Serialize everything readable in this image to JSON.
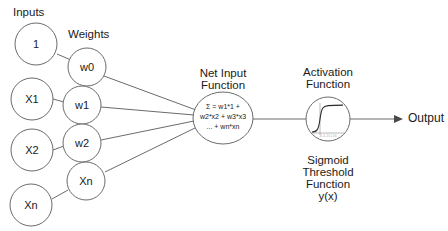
{
  "diagram": {
    "title_labels": {
      "inputs": "Inputs",
      "weights": "Weights",
      "net_input_function_line1": "Net Input",
      "net_input_function_line2": "Function",
      "activation_function_line1": "Activation",
      "activation_function_line2": "Function",
      "sigmoid_caption_line1": "Sigmoid",
      "sigmoid_caption_line2": "Threshold",
      "sigmoid_caption_line3": "Function",
      "sigmoid_caption_line4": "y(x)",
      "output": "Output"
    },
    "input_nodes": [
      {
        "label": "1"
      },
      {
        "label": "X1"
      },
      {
        "label": "X2"
      },
      {
        "label": "Xn"
      }
    ],
    "weight_nodes": [
      {
        "label": "w0"
      },
      {
        "label": "w1"
      },
      {
        "label": "w2"
      },
      {
        "label": "Xn"
      }
    ],
    "net_input_formula": [
      "Σ = w1*1 +",
      "w2*x2 + w3*x3",
      "... + wn*xn"
    ],
    "sigmoid_plot": {
      "tick_label": "-6 -4 -2 0 2 4 6"
    },
    "colors": {
      "stroke": "#6b6b6b",
      "text": "#1a1a1a",
      "background": "#ffffff",
      "arrow": "#4a4a4a"
    }
  }
}
